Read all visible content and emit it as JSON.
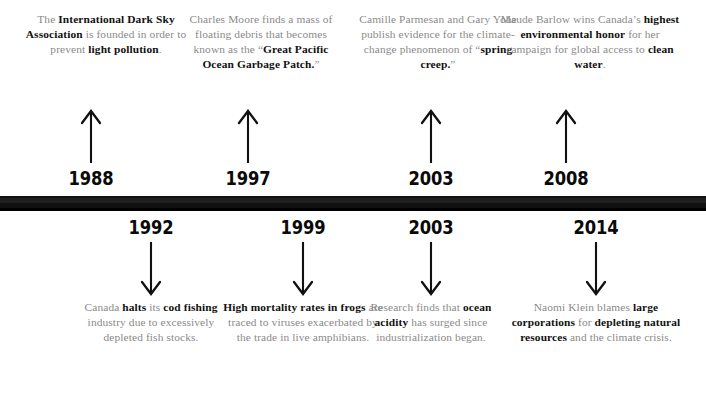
{
  "timeline": {
    "bar_color": "#111111",
    "body_text_color": "#8a8a8a",
    "emphasis_color": "#111111",
    "entries_above": [
      {
        "year": "1988",
        "arrow": "up-arrow-icon",
        "segments": [
          {
            "text": "The ",
            "bold": false
          },
          {
            "text": "International Dark Sky Association",
            "bold": true
          },
          {
            "text": " is founded in order to prevent ",
            "bold": false
          },
          {
            "text": "light pollution",
            "bold": true
          },
          {
            "text": ".",
            "bold": false
          }
        ]
      },
      {
        "year": "1997",
        "arrow": "up-arrow-icon",
        "segments": [
          {
            "text": "Charles Moore finds a mass of floating debris that becomes known as the “",
            "bold": false
          },
          {
            "text": "Great Pacific Ocean Garbage Patch.",
            "bold": true
          },
          {
            "text": "”",
            "bold": false
          }
        ]
      },
      {
        "year": "2003",
        "arrow": "up-arrow-icon",
        "segments": [
          {
            "text": "Camille Parmesan and Gary Yohe publish evidence for the climate-change phenomenon of “",
            "bold": false
          },
          {
            "text": "spring creep.",
            "bold": true
          },
          {
            "text": "”",
            "bold": false
          }
        ]
      },
      {
        "year": "2008",
        "arrow": "up-arrow-icon",
        "segments": [
          {
            "text": "Maude Barlow wins Canada’s ",
            "bold": false
          },
          {
            "text": "highest environmental honor",
            "bold": true
          },
          {
            "text": " for her campaign for global access to ",
            "bold": false
          },
          {
            "text": "clean water",
            "bold": true
          },
          {
            "text": ".",
            "bold": false
          }
        ]
      }
    ],
    "entries_below": [
      {
        "year": "1992",
        "arrow": "down-arrow-icon",
        "segments": [
          {
            "text": "Canada ",
            "bold": false
          },
          {
            "text": "halts",
            "bold": true
          },
          {
            "text": " its ",
            "bold": false
          },
          {
            "text": "cod fishing",
            "bold": true
          },
          {
            "text": " industry due to excessively depleted fish stocks.",
            "bold": false
          }
        ]
      },
      {
        "year": "1999",
        "arrow": "down-arrow-icon",
        "segments": [
          {
            "text": "High mortality rates in frogs",
            "bold": true
          },
          {
            "text": " are traced to viruses exacerbated by the trade in live amphibians.",
            "bold": false
          }
        ]
      },
      {
        "year": "2003",
        "arrow": "down-arrow-icon",
        "segments": [
          {
            "text": "Research finds that ",
            "bold": false
          },
          {
            "text": "ocean acidity",
            "bold": true
          },
          {
            "text": " has surged since industrialization began.",
            "bold": false
          }
        ]
      },
      {
        "year": "2014",
        "arrow": "down-arrow-icon",
        "segments": [
          {
            "text": "Naomi Klein blames ",
            "bold": false
          },
          {
            "text": "large corporations",
            "bold": true
          },
          {
            "text": " for ",
            "bold": false
          },
          {
            "text": "depleting natural resources",
            "bold": true
          },
          {
            "text": " and the climate crisis.",
            "bold": false
          }
        ]
      }
    ]
  }
}
